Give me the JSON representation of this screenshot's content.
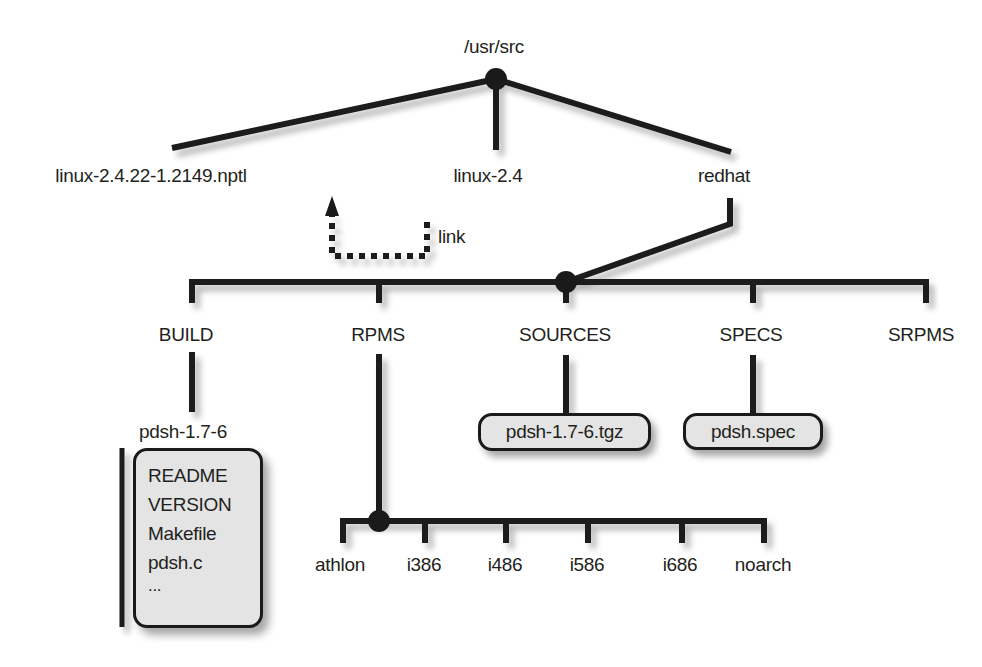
{
  "diagram": {
    "colors": {
      "line": "#1a1a1a",
      "text": "#231f20",
      "box_fill": "#e4e4e4",
      "background": "#ffffff"
    },
    "root": {
      "label": "/usr/src"
    },
    "level1": [
      {
        "label": "linux-2.4.22-1.2149.nptl"
      },
      {
        "label": "linux-2.4"
      },
      {
        "label": "redhat"
      }
    ],
    "link": {
      "label": "link",
      "from": "linux-2.4",
      "to": "linux-2.4.22-1.2149.nptl",
      "style": "dashed-arrow"
    },
    "redhat_children": [
      {
        "label": "BUILD"
      },
      {
        "label": "RPMS"
      },
      {
        "label": "SOURCES"
      },
      {
        "label": "SPECS"
      },
      {
        "label": "SRPMS"
      }
    ],
    "build": {
      "subdir": "pdsh-1.7-6",
      "files": [
        "README",
        "VERSION",
        "Makefile",
        "pdsh.c",
        "..."
      ]
    },
    "sources": {
      "file": "pdsh-1.7-6.tgz"
    },
    "specs": {
      "file": "pdsh.spec"
    },
    "rpms_children": [
      {
        "label": "athlon"
      },
      {
        "label": "i386"
      },
      {
        "label": "i486"
      },
      {
        "label": "i586"
      },
      {
        "label": "i686"
      },
      {
        "label": "noarch"
      }
    ]
  }
}
